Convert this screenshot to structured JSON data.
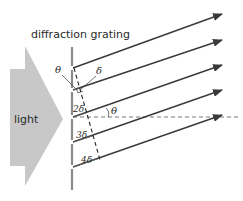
{
  "diagram": {
    "title_label": "diffraction grating",
    "source_label": "light",
    "angle_label_top": "θ",
    "delta_label": "δ",
    "angle_label_mid": "θ",
    "path_labels": [
      "2δ",
      "3δ",
      "4δ"
    ],
    "colors": {
      "light_arrow": "#c8c8c8",
      "grating": "#8a8a8a",
      "rays": "#3a3a3a",
      "dashed": "#555555"
    },
    "rays": [
      {
        "x1": 73,
        "y1": 68,
        "x2": 223,
        "y2": 14
      },
      {
        "x1": 73,
        "y1": 90,
        "x2": 223,
        "y2": 40
      },
      {
        "x1": 73,
        "y1": 117,
        "x2": 223,
        "y2": 65
      },
      {
        "x1": 73,
        "y1": 142,
        "x2": 223,
        "y2": 90
      },
      {
        "x1": 73,
        "y1": 167,
        "x2": 223,
        "y2": 115
      }
    ]
  }
}
